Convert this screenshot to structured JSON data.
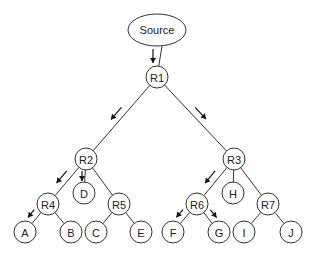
{
  "diagram": {
    "type": "multicast-tree",
    "source": {
      "id": "source",
      "label": "Source",
      "cx": 157,
      "cy": 30,
      "rx": 29,
      "ry": 16
    },
    "nodes": [
      {
        "id": "R1",
        "label": "R1",
        "cx": 157,
        "cy": 77
      },
      {
        "id": "R2",
        "label": "R2",
        "cx": 86,
        "cy": 159
      },
      {
        "id": "R3",
        "label": "R3",
        "cx": 234,
        "cy": 159
      },
      {
        "id": "D",
        "label": "D",
        "cx": 84,
        "cy": 193
      },
      {
        "id": "H",
        "label": "H",
        "cx": 233,
        "cy": 193
      },
      {
        "id": "R4",
        "label": "R4",
        "cx": 48,
        "cy": 204
      },
      {
        "id": "R5",
        "label": "R5",
        "cx": 119,
        "cy": 204
      },
      {
        "id": "R6",
        "label": "R6",
        "cx": 197,
        "cy": 204
      },
      {
        "id": "R7",
        "label": "R7",
        "cx": 268,
        "cy": 204
      },
      {
        "id": "A",
        "label": "A",
        "cx": 25,
        "cy": 232
      },
      {
        "id": "B",
        "label": "B",
        "cx": 71,
        "cy": 232
      },
      {
        "id": "C",
        "label": "C",
        "cx": 96,
        "cy": 232
      },
      {
        "id": "E",
        "label": "E",
        "cx": 141,
        "cy": 232
      },
      {
        "id": "F",
        "label": "F",
        "cx": 173,
        "cy": 232
      },
      {
        "id": "G",
        "label": "G",
        "cx": 219,
        "cy": 232
      },
      {
        "id": "I",
        "label": "I",
        "cx": 244,
        "cy": 232
      },
      {
        "id": "J",
        "label": "J",
        "cx": 291,
        "cy": 232
      }
    ],
    "edges": [
      [
        "source",
        "R1"
      ],
      [
        "R1",
        "R2"
      ],
      [
        "R1",
        "R3"
      ],
      [
        "R2",
        "D"
      ],
      [
        "R2",
        "R4"
      ],
      [
        "R2",
        "R5"
      ],
      [
        "R3",
        "H"
      ],
      [
        "R3",
        "R6"
      ],
      [
        "R3",
        "R7"
      ],
      [
        "R4",
        "A"
      ],
      [
        "R4",
        "B"
      ],
      [
        "R5",
        "C"
      ],
      [
        "R5",
        "E"
      ],
      [
        "R6",
        "F"
      ],
      [
        "R6",
        "G"
      ],
      [
        "R7",
        "I"
      ],
      [
        "R7",
        "J"
      ]
    ],
    "flow_arrows": [
      {
        "from": "source",
        "to": "R1"
      },
      {
        "from": "R1",
        "to": "R2"
      },
      {
        "from": "R1",
        "to": "R3"
      },
      {
        "from": "R2",
        "to": "R4"
      },
      {
        "from": "R2",
        "to": "D"
      },
      {
        "from": "R4",
        "to": "A"
      },
      {
        "from": "R3",
        "to": "R6"
      },
      {
        "from": "R6",
        "to": "F"
      },
      {
        "from": "R6",
        "to": "G"
      }
    ],
    "node_radius": 11
  }
}
